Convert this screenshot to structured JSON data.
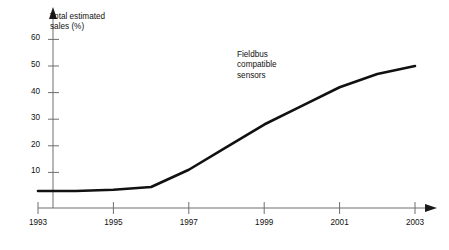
{
  "chart_data": {
    "type": "line",
    "title": "",
    "axis_title": "Total estimated\nsales (%)",
    "ylabel": "Total estimated sales (%)",
    "xlabel": "",
    "grid": false,
    "legend_position": "none",
    "xlim": [
      1993,
      2003
    ],
    "ylim": [
      0,
      65
    ],
    "x_ticks": [
      1993,
      1995,
      1997,
      1999,
      2001,
      2003
    ],
    "x_tick_labels": [
      "1993",
      "1995",
      "1997",
      "1999",
      "2001",
      "2003"
    ],
    "y_ticks": [
      10,
      20,
      30,
      40,
      50,
      60
    ],
    "y_tick_labels": [
      "10",
      "20",
      "30",
      "40",
      "50",
      "60"
    ],
    "series": [
      {
        "name": "Fieldbus compatible sensors",
        "annotation": "Fieldbus\ncompatible\nsensors",
        "color": "#111111",
        "x": [
          1993,
          1994,
          1995,
          1996,
          1997,
          1998,
          1999,
          2000,
          2001,
          2002,
          2003
        ],
        "values": [
          3,
          3,
          3.5,
          4.5,
          11,
          19.5,
          28,
          35,
          42,
          47,
          50
        ]
      }
    ]
  },
  "annotations": {
    "axis_title_line1": "Total estimated",
    "axis_title_line2": "sales (%)",
    "series_label_line1": "Fieldbus",
    "series_label_line2": "compatible",
    "series_label_line3": "sensors"
  },
  "colors": {
    "series": "#111111",
    "axis": "#6e6e6e",
    "tick": "#6e6e6e",
    "text": "#111111",
    "background": "#ffffff"
  }
}
